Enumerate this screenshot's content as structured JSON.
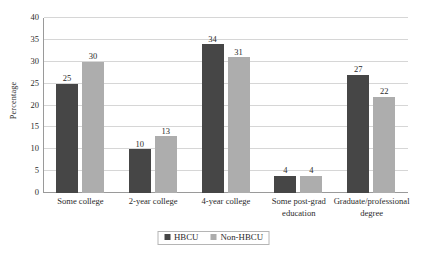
{
  "chart_data": {
    "type": "bar",
    "title": "",
    "subtitle": "",
    "xlabel": "",
    "ylabel": "Percentage",
    "ylim": [
      0,
      40
    ],
    "ytick_step": 5,
    "ytick_labels": [
      "0",
      "5",
      "10",
      "15",
      "20",
      "25",
      "30",
      "35",
      "40"
    ],
    "grid": "horizontal",
    "legend_position": "bottom-center",
    "categories": [
      "Some college",
      "2-year college",
      "4-year college",
      "Some post-grad education",
      "Graduate/professional degree"
    ],
    "category_lines": [
      [
        "Some college"
      ],
      [
        "2-year college"
      ],
      [
        "4-year college"
      ],
      [
        "Some post-grad",
        "education"
      ],
      [
        "Graduate/professional",
        "degree"
      ]
    ],
    "series": [
      {
        "name": "HBCU",
        "color": "#464646",
        "values": [
          25,
          10,
          34,
          4,
          27
        ],
        "labels": [
          "25",
          "10",
          "34",
          "4",
          "27"
        ]
      },
      {
        "name": "Non-HBCU",
        "color": "#adadad",
        "values": [
          30,
          13,
          31,
          4,
          22
        ],
        "labels": [
          "30",
          "13",
          "31",
          "4",
          "22"
        ]
      }
    ]
  },
  "legend": {
    "items": [
      {
        "label": "HBCU",
        "color": "#464646"
      },
      {
        "label": "Non-HBCU",
        "color": "#adadad"
      }
    ]
  },
  "colors": {
    "background": "#ffffff",
    "gridline": "#d6d6d6",
    "axis": "#9a9a9a",
    "text": "#2b2b2b",
    "series_hbcu": "#464646",
    "series_non_hbcu": "#adadad"
  }
}
